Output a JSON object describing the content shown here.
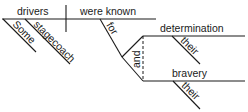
{
  "diagram": {
    "type": "sentence-diagram",
    "subject": "drivers",
    "predicate": "were known",
    "subject_modifiers": [
      "Some",
      "stagecoach"
    ],
    "preposition": "for",
    "conjunction": "and",
    "compound_objects": [
      {
        "word": "determination",
        "modifier": "their"
      },
      {
        "word": "bravery",
        "modifier": "their"
      }
    ]
  }
}
